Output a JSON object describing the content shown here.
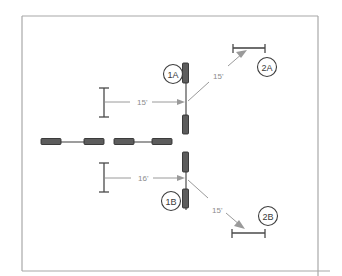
{
  "drawing": {
    "title": "Framing Dimension Diagram",
    "background_color": "#ffffff",
    "border_color": "#a8a8a8",
    "dimension_color": "#9a9a9a",
    "member_color": "#3d3d3d",
    "cap_color": "#5c5c5c"
  },
  "dimensions": [
    {
      "id": "upper-left",
      "label": "15'",
      "orientation": "horizontal",
      "x": 137,
      "y": 101
    },
    {
      "id": "upper-diagonal",
      "label": "15'",
      "orientation": "diagonal",
      "x": 213,
      "y": 76
    },
    {
      "id": "lower-left",
      "label": "16'",
      "orientation": "horizontal",
      "x": 138,
      "y": 178
    },
    {
      "id": "lower-diagonal",
      "label": "15'",
      "orientation": "diagonal",
      "x": 212,
      "y": 210
    }
  ],
  "callouts": [
    {
      "id": "callout-1a",
      "label": "1A",
      "cx": 173,
      "cy": 74
    },
    {
      "id": "callout-2a",
      "label": "2A",
      "cx": 267,
      "cy": 67
    },
    {
      "id": "callout-1b",
      "label": "1B",
      "cx": 171,
      "cy": 201
    },
    {
      "id": "callout-2b",
      "label": "2B",
      "cx": 268,
      "cy": 216
    }
  ],
  "members": [
    {
      "id": "vertical-member-upper",
      "orientation": "vertical"
    },
    {
      "id": "vertical-member-lower",
      "orientation": "vertical"
    },
    {
      "id": "horizontal-member-left",
      "orientation": "horizontal"
    },
    {
      "id": "horizontal-member-right",
      "orientation": "horizontal"
    }
  ]
}
